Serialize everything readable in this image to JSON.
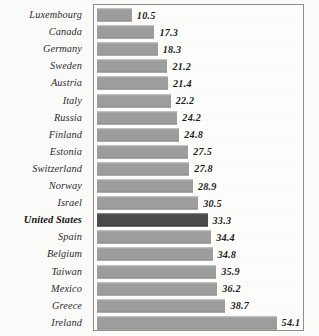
{
  "chart_data": {
    "type": "bar",
    "orientation": "horizontal",
    "title": "",
    "subtitle": "",
    "xlabel": "",
    "ylabel": "",
    "grid": false,
    "legend": null,
    "xlim": [
      0,
      62
    ],
    "value_labels_shown": true,
    "sort_order": "ascending",
    "categories": [
      "Luxembourg",
      "Canada",
      "Germany",
      "Sweden",
      "Austria",
      "Italy",
      "Russia",
      "Finland",
      "Estonia",
      "Switzerland",
      "Norway",
      "Israel",
      "United States",
      "Spain",
      "Belgium",
      "Taiwan",
      "Mexico",
      "Greece",
      "Ireland"
    ],
    "values": [
      10.5,
      17.3,
      18.3,
      21.2,
      21.4,
      22.2,
      24.2,
      24.8,
      27.5,
      27.8,
      28.9,
      30.5,
      33.3,
      34.4,
      34.8,
      35.9,
      36.2,
      38.7,
      54.1
    ],
    "value_text": [
      "10.5",
      "17.3",
      "18.3",
      "21.2",
      "21.4",
      "22.2",
      "24.2",
      "24.8",
      "27.5",
      "27.8",
      "28.9",
      "30.5",
      "33.3",
      "34.4",
      "34.8",
      "35.9",
      "36.2",
      "38.7",
      "54.1"
    ],
    "highlight_category": "United States",
    "colors": {
      "bar": "#9d9d9d",
      "bar_highlight": "#4a4a4a",
      "plot_border": "#8e8e8e",
      "background": "#fbfbfa",
      "plot_background": "#fdfdfc",
      "label_text": "#2e2e2e",
      "value_text": "#1d1d1d"
    }
  }
}
